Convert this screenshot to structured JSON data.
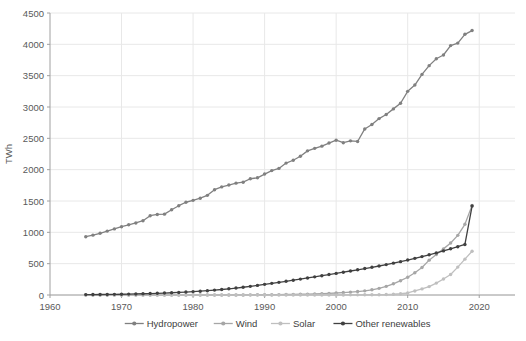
{
  "chart_data": {
    "type": "line",
    "title": "",
    "xlabel": "",
    "ylabel": "TWh",
    "xlim": [
      1960,
      2025
    ],
    "ylim": [
      0,
      4500
    ],
    "xticks": [
      1960,
      1970,
      1980,
      1990,
      2000,
      2010,
      2020
    ],
    "yticks": [
      0,
      500,
      1000,
      1500,
      2000,
      2500,
      3000,
      3500,
      4000,
      4500
    ],
    "grid": true,
    "legend_position": "bottom",
    "x": [
      1965,
      1966,
      1967,
      1968,
      1969,
      1970,
      1971,
      1972,
      1973,
      1974,
      1975,
      1976,
      1977,
      1978,
      1979,
      1980,
      1981,
      1982,
      1983,
      1984,
      1985,
      1986,
      1987,
      1988,
      1989,
      1990,
      1991,
      1992,
      1993,
      1994,
      1995,
      1996,
      1997,
      1998,
      1999,
      2000,
      2001,
      2002,
      2003,
      2004,
      2005,
      2006,
      2007,
      2008,
      2009,
      2010,
      2011,
      2012,
      2013,
      2014,
      2015,
      2016,
      2017,
      2018,
      2019
    ],
    "series": [
      {
        "name": "Hydropower",
        "color": "#808080",
        "values": [
          930,
          955,
          985,
          1020,
          1055,
          1090,
          1120,
          1150,
          1185,
          1265,
          1285,
          1290,
          1360,
          1425,
          1480,
          1510,
          1545,
          1590,
          1680,
          1725,
          1755,
          1785,
          1800,
          1855,
          1870,
          1930,
          1985,
          2020,
          2105,
          2150,
          2215,
          2300,
          2340,
          2375,
          2425,
          2470,
          2430,
          2460,
          2450,
          2650,
          2720,
          2815,
          2880,
          2970,
          3060,
          3250,
          3350,
          3520,
          3660,
          3770,
          3830,
          3980,
          4020,
          4160,
          4220
        ]
      },
      {
        "name": "Wind",
        "color": "#a6a6a6",
        "values": [
          0,
          0,
          0,
          0,
          0,
          0,
          0,
          0,
          0,
          0,
          0,
          0,
          0,
          0,
          0,
          0,
          0,
          0,
          0,
          0,
          1,
          1,
          1,
          2,
          3,
          4,
          5,
          6,
          8,
          10,
          13,
          14,
          17,
          22,
          26,
          32,
          39,
          46,
          55,
          66,
          83,
          106,
          138,
          179,
          228,
          283,
          356,
          438,
          556,
          645,
          736,
          829,
          952,
          1128,
          1430
        ]
      },
      {
        "name": "Solar",
        "color": "#bfbfbf",
        "values": [
          0,
          0,
          0,
          0,
          0,
          0,
          0,
          0,
          0,
          0,
          0,
          0,
          0,
          0,
          0,
          0,
          0,
          0,
          0,
          0,
          0,
          0,
          0,
          0,
          0,
          0,
          0,
          0,
          0,
          0,
          0,
          1,
          1,
          1,
          1,
          1,
          1,
          2,
          2,
          3,
          4,
          5,
          7,
          12,
          20,
          32,
          64,
          97,
          134,
          190,
          256,
          328,
          445,
          572,
          699
        ]
      },
      {
        "name": "Other renewables",
        "color": "#404040",
        "values": [
          6,
          7,
          8,
          9,
          10,
          12,
          14,
          17,
          20,
          23,
          27,
          31,
          36,
          41,
          47,
          54,
          61,
          69,
          78,
          88,
          99,
          111,
          124,
          138,
          153,
          170,
          186,
          202,
          219,
          236,
          254,
          272,
          290,
          308,
          326,
          345,
          364,
          383,
          402,
          422,
          442,
          463,
          485,
          508,
          532,
          558,
          585,
          613,
          642,
          672,
          704,
          737,
          771,
          806,
          1420
        ]
      }
    ]
  },
  "legend": {
    "items": [
      {
        "label": "Hydropower"
      },
      {
        "label": "Wind"
      },
      {
        "label": "Solar"
      },
      {
        "label": "Other renewables"
      }
    ]
  },
  "axis": {
    "y_title": "TWh",
    "y_tick_labels": [
      "0",
      "500",
      "1000",
      "1500",
      "2000",
      "2500",
      "3000",
      "3500",
      "4000",
      "4500"
    ],
    "x_tick_labels": [
      "1960",
      "1970",
      "1980",
      "1990",
      "2000",
      "2010",
      "2020"
    ]
  },
  "colors": {
    "grid": "#e8e8e8",
    "axis": "#a0a0a0",
    "text": "#595959"
  }
}
